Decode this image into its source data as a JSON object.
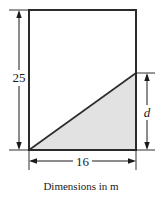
{
  "figure": {
    "caption": "Dimensions in m",
    "labels": {
      "height": "25",
      "width": "16",
      "depth": "d"
    },
    "colors": {
      "outline": "#2b2b2b",
      "fill": "#e2e2e2",
      "background": "#ffffff",
      "text": "#1a1a1a",
      "dimension_line": "#1a1a1a"
    },
    "geometry": {
      "rect_left": 29,
      "rect_top": 10,
      "rect_right": 136,
      "rect_bottom": 150,
      "diagonal_right_y": 73
    },
    "shape_names": {
      "container": "rectangular-tank-outline",
      "shaded": "shaded-liquid-triangle",
      "diagonal": "liquid-surface-diagonal"
    },
    "units": "m"
  }
}
